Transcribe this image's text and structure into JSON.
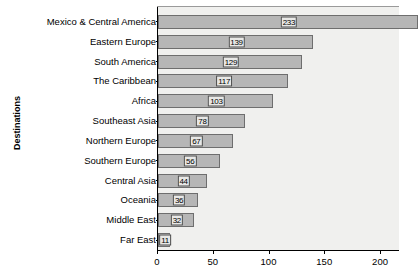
{
  "chart_data": {
    "type": "bar",
    "orientation": "horizontal",
    "title": "",
    "xlabel": "",
    "ylabel": "Destinations",
    "categories": [
      "Mexico & Central America",
      "Eastern Europe",
      "South America",
      "The Caribbean",
      "Africa",
      "Southeast Asia",
      "Northern Europe",
      "Southern Europe",
      "Central Asia",
      "Oceania",
      "Middle East",
      "Far East"
    ],
    "values": [
      233,
      139,
      129,
      117,
      103,
      78,
      67,
      56,
      44,
      36,
      32,
      11
    ],
    "data_labels": [
      "233",
      "139",
      "129",
      "117",
      "103",
      "78",
      "67",
      "56",
      "44",
      "36",
      "32",
      "11"
    ],
    "xticks": [
      0,
      50,
      100,
      150,
      200
    ],
    "xtick_labels": [
      "0",
      "50",
      "100",
      "150",
      "200"
    ],
    "xlim": [
      0,
      217
    ],
    "grid": false,
    "legend": null,
    "bar_color": "#b6b6b6",
    "bar_edge_color": "#6e6e6e",
    "plot_background": "#f0f0ee",
    "label_box_color": "#e8e8e6",
    "note": "Topmost bar extends past the right edge of the visible plot area"
  }
}
